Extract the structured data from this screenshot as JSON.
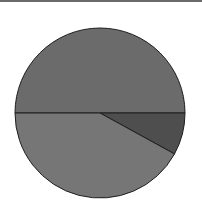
{
  "chart_data": {
    "type": "pie",
    "title": "",
    "labels": [
      "Slice A",
      "Slice B",
      "Slice C"
    ],
    "values": [
      50,
      8,
      42
    ],
    "colors": [
      "#6b6b6b",
      "#4e4e4e",
      "#767676"
    ],
    "start_angle_deg": 180,
    "direction": "clockwise",
    "legend": "none",
    "center": [
      100,
      113
    ],
    "radius": 85
  }
}
